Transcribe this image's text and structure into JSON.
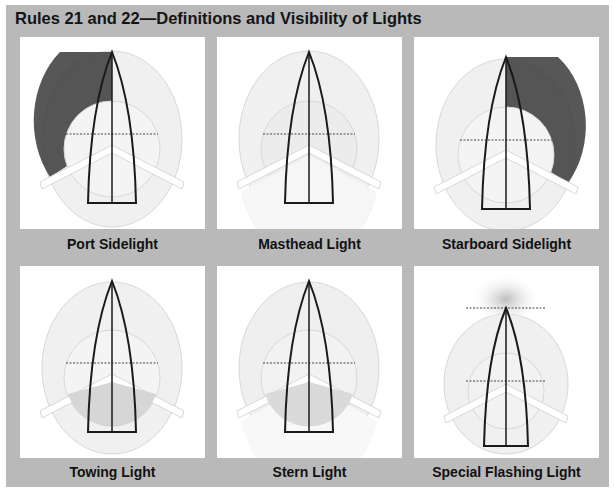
{
  "title": "Rules 21 and 22—Definitions and Visibility of Lights",
  "colors": {
    "frame_background": "#b9b9b9",
    "panel_background": "#ffffff",
    "sector_fill": "#eeeeee",
    "sector_stroke": "#d6d6d6",
    "lit_sector_dark": "#4a4a4a",
    "lit_sector_light": "#cfcfcf",
    "hull_stroke": "#1a1a1a"
  },
  "panels": [
    {
      "id": "port-sidelight",
      "label": "Port Sidelight",
      "highlight": "port-sector (112.5° arc forward-to-port, dark)"
    },
    {
      "id": "masthead-light",
      "label": "Masthead Light",
      "highlight": "forward 225° arc (light)"
    },
    {
      "id": "starboard-sidelight",
      "label": "Starboard Sidelight",
      "highlight": "starboard-sector (112.5° arc forward-to-starboard, dark)"
    },
    {
      "id": "towing-light",
      "label": "Towing Light",
      "highlight": "stern 135° arc (light)"
    },
    {
      "id": "stern-light",
      "label": "Stern Light",
      "highlight": "stern 135° arc (light)"
    },
    {
      "id": "special-flashing-light",
      "label": "Special Flashing Light",
      "highlight": "forward arc at bow (light)"
    }
  ]
}
